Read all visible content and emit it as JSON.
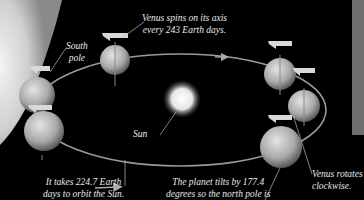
{
  "diagram": {
    "labels": {
      "south_pole": [
        "South",
        "pole"
      ],
      "spins": [
        "Venus spins on its axis",
        "every 243 Earth days."
      ],
      "sun": "Sun",
      "orbit": [
        "It takes 224.7 Earth",
        "days to orbit the Sun."
      ],
      "tilt": [
        "The planet tilts by 177.4",
        "degrees so the north pole is"
      ],
      "rotates": [
        "Venus rotates",
        "clockwise."
      ]
    },
    "colors": {
      "background": "#000000",
      "text": "#e8e8e8",
      "orbit": "#9a9a9a",
      "panel": "#707070"
    },
    "sun": {
      "cx": 182,
      "cy": 99,
      "r": 17
    },
    "orbit": {
      "cx": 180,
      "cy": 110,
      "rx": 146,
      "ry": 56
    },
    "planets": [
      {
        "cx": 115,
        "cy": 60,
        "r": 15
      },
      {
        "cx": 280,
        "cy": 74,
        "r": 16
      },
      {
        "cx": 304,
        "cy": 106,
        "r": 16
      },
      {
        "cx": 37,
        "cy": 95,
        "r": 18
      },
      {
        "cx": 44,
        "cy": 131,
        "r": 20
      },
      {
        "cx": 281,
        "cy": 147,
        "r": 21
      }
    ]
  }
}
